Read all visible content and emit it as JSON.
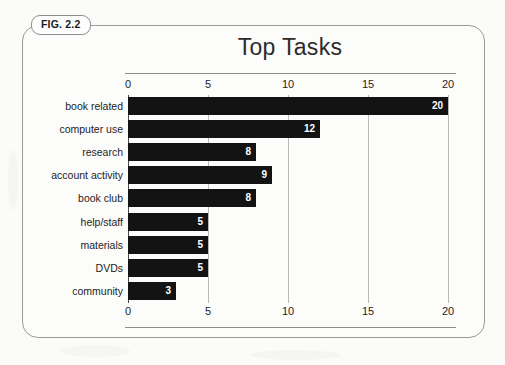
{
  "figure": {
    "badge_label": "FIG. 2.2"
  },
  "chart_data": {
    "type": "bar",
    "orientation": "horizontal",
    "title": "Top Tasks",
    "xlabel": "",
    "ylabel": "",
    "xlim": [
      0,
      20
    ],
    "xticks": [
      0,
      5,
      10,
      15,
      20
    ],
    "xtick_labels": [
      "0",
      "5",
      "10",
      "15",
      "20"
    ],
    "axis_positions": [
      "top",
      "bottom"
    ],
    "grid": true,
    "legend": "none",
    "bar_color": "#131313",
    "value_label_color": "#ffffff",
    "categories": [
      "book related",
      "computer use",
      "research",
      "account activity",
      "book club",
      "help/staff",
      "materials",
      "DVDs",
      "community"
    ],
    "values": [
      20,
      12,
      8,
      9,
      8,
      5,
      5,
      5,
      3
    ],
    "value_labels": [
      "20",
      "12",
      "8",
      "9",
      "8",
      "5",
      "5",
      "5",
      "3"
    ]
  }
}
